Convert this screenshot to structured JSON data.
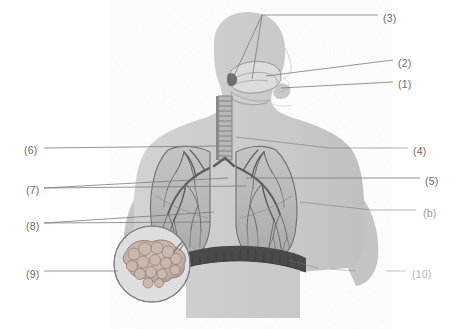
{
  "figure": {
    "type": "labeled-anatomical-illustration",
    "style": "grayscale halftone scan",
    "orientation": "head in right-facing profile, torso frontal",
    "background_color": "#ffffff",
    "colors": {
      "body_silhouette": "#cbcbcb",
      "body_silhouette_shadow": "#bdbdbd",
      "lung_fill": "#b9b9b9",
      "lung_outline": "#6e6e6e",
      "bronchial_tree": "#5c5c5c",
      "trachea": "#9e9e9e",
      "diaphragm": "#4a4a4a",
      "larynx": "#d8d8d8",
      "alveoli_inset": "#c2b0a6",
      "leader_line": "#7a7a7a",
      "label_text": "#6b6b6b"
    }
  },
  "labels": [
    {
      "id": "1",
      "text": "(1)",
      "x": 398,
      "y": 79,
      "faded": "none",
      "target": "nasal cavity / pharynx"
    },
    {
      "id": "2",
      "text": "(2)",
      "x": 398,
      "y": 58,
      "faded": "none",
      "target": "larynx"
    },
    {
      "id": "3",
      "text": "(3)",
      "x": 383,
      "y": 13,
      "faded": "none",
      "target": "upper airway pair"
    },
    {
      "id": "4",
      "text": "(4)",
      "x": 413,
      "y": 146,
      "faded": "none",
      "target": "trachea"
    },
    {
      "id": "5",
      "text": "(5)",
      "x": 425,
      "y": 176,
      "faded": "none",
      "target": "primary bronchus"
    },
    {
      "id": "6r",
      "text": "(b)",
      "x": 423,
      "y": 208,
      "faded": "light",
      "target": "lung lobe"
    },
    {
      "id": "6",
      "text": "(6)",
      "x": 24,
      "y": 145,
      "faded": "none",
      "target": "trachea (left leader)"
    },
    {
      "id": "7",
      "text": "(7)",
      "x": 26,
      "y": 185,
      "faded": "none",
      "target": "bronchi / bronchioles"
    },
    {
      "id": "8",
      "text": "(8)",
      "x": 26,
      "y": 221,
      "faded": "none",
      "target": "bronchioles"
    },
    {
      "id": "9",
      "text": "(9)",
      "x": 26,
      "y": 269,
      "faded": "none",
      "target": "alveoli cluster inset"
    },
    {
      "id": "10",
      "text": "(10)",
      "x": 412,
      "y": 269,
      "faded": "heavy",
      "target": "diaphragm"
    }
  ],
  "structures": [
    {
      "name": "head-profile",
      "description": "right-facing human head and neck silhouette"
    },
    {
      "name": "larynx-detail",
      "description": "enlarged larynx and epiglottis cutaway at throat"
    },
    {
      "name": "trachea",
      "description": "segmented windpipe with cartilage rings descending from larynx"
    },
    {
      "name": "left-lung",
      "description": "lung with branching bronchial tree"
    },
    {
      "name": "right-lung",
      "description": "lung with branching bronchial tree"
    },
    {
      "name": "diaphragm",
      "description": "dark muscular band beneath the lungs"
    },
    {
      "name": "alveoli-inset",
      "description": "circular magnified view of alveoli lobules"
    },
    {
      "name": "torso-silhouette",
      "description": "shoulders, arms and abdomen outline"
    }
  ]
}
